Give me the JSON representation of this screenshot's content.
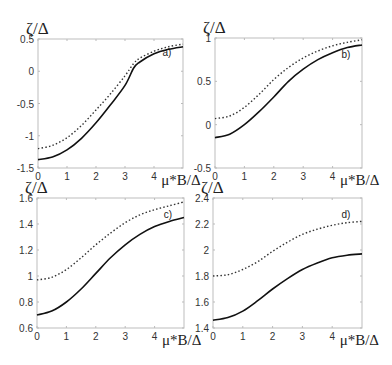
{
  "chart_data": [
    {
      "type": "line",
      "panel": "a)",
      "ylabel": "ζ/Δ",
      "xlabel": "μ*B/Δ",
      "xlim": [
        0,
        5
      ],
      "ylim": [
        -1.5,
        0.5
      ],
      "xticks": [
        "0",
        "1",
        "2",
        "3",
        "4"
      ],
      "yticks": [
        "0.5",
        "0",
        "-0.5",
        "-1",
        "-1.5"
      ],
      "box": {
        "left": 38,
        "top": 39,
        "right": 183,
        "bottom": 168
      },
      "x": [
        0,
        0.5,
        1,
        1.5,
        2,
        2.5,
        3,
        3.3,
        3.5,
        4,
        4.5,
        5
      ],
      "series": [
        {
          "name": "solid",
          "style": "solid",
          "values": [
            -1.37,
            -1.33,
            -1.22,
            -1.04,
            -0.8,
            -0.52,
            -0.22,
            0.05,
            0.14,
            0.27,
            0.34,
            0.38
          ]
        },
        {
          "name": "dotted",
          "style": "dotted",
          "values": [
            -1.2,
            -1.15,
            -1.03,
            -0.84,
            -0.6,
            -0.35,
            -0.07,
            0.12,
            0.2,
            0.31,
            0.38,
            0.42
          ]
        }
      ]
    },
    {
      "type": "line",
      "panel": "b)",
      "ylabel": "ζ/Δ",
      "xlabel": "μ*B/Δ",
      "xlim": [
        0,
        5
      ],
      "ylim": [
        -0.5,
        1
      ],
      "xticks": [
        "0",
        "1",
        "2",
        "3",
        "4"
      ],
      "yticks": [
        "1",
        "0.5",
        "0",
        "-0.5"
      ],
      "box": {
        "left": 215,
        "top": 38,
        "right": 362,
        "bottom": 168
      },
      "x": [
        0,
        0.5,
        1,
        1.5,
        2,
        2.5,
        3,
        3.5,
        4,
        4.5,
        5
      ],
      "series": [
        {
          "name": "solid",
          "style": "solid",
          "values": [
            -0.15,
            -0.11,
            0.0,
            0.15,
            0.32,
            0.5,
            0.64,
            0.75,
            0.83,
            0.89,
            0.92
          ]
        },
        {
          "name": "dotted",
          "style": "dotted",
          "values": [
            0.07,
            0.1,
            0.2,
            0.35,
            0.52,
            0.66,
            0.77,
            0.85,
            0.91,
            0.95,
            0.98
          ]
        }
      ]
    },
    {
      "type": "line",
      "panel": "c)",
      "ylabel": "ζ/Δ",
      "xlabel": "μ*B/Δ",
      "xlim": [
        0,
        5
      ],
      "ylim": [
        0.6,
        1.6
      ],
      "xticks": [
        "0",
        "1",
        "2",
        "3",
        "4"
      ],
      "yticks": [
        "1.6",
        "1.4",
        "1.2",
        "1",
        "0.8",
        "0.6"
      ],
      "box": {
        "left": 37,
        "top": 198,
        "right": 184,
        "bottom": 328
      },
      "x": [
        0,
        0.5,
        1,
        1.5,
        2,
        2.5,
        3,
        3.5,
        4,
        4.5,
        5
      ],
      "series": [
        {
          "name": "solid",
          "style": "solid",
          "values": [
            0.7,
            0.73,
            0.8,
            0.9,
            1.02,
            1.14,
            1.24,
            1.32,
            1.38,
            1.42,
            1.45
          ]
        },
        {
          "name": "dotted",
          "style": "dotted",
          "values": [
            0.97,
            0.99,
            1.05,
            1.14,
            1.24,
            1.33,
            1.41,
            1.47,
            1.51,
            1.54,
            1.57
          ]
        }
      ]
    },
    {
      "type": "line",
      "panel": "d)",
      "ylabel": "ζ/Δ",
      "xlabel": "μ*B/Δ",
      "xlim": [
        0,
        5
      ],
      "ylim": [
        1.4,
        2.4
      ],
      "xticks": [
        "0",
        "1",
        "2",
        "3",
        "4"
      ],
      "yticks": [
        "2.4",
        "2.2",
        "2",
        "1.8",
        "1.6",
        "1.4"
      ],
      "box": {
        "left": 213,
        "top": 198,
        "right": 362,
        "bottom": 328
      },
      "x": [
        0,
        0.5,
        1,
        1.5,
        2,
        2.5,
        3,
        3.5,
        4,
        4.5,
        5
      ],
      "series": [
        {
          "name": "solid",
          "style": "solid",
          "values": [
            1.46,
            1.48,
            1.53,
            1.61,
            1.7,
            1.78,
            1.85,
            1.9,
            1.94,
            1.96,
            1.97
          ]
        },
        {
          "name": "dotted",
          "style": "dotted",
          "values": [
            1.8,
            1.81,
            1.85,
            1.91,
            1.99,
            2.06,
            2.12,
            2.16,
            2.19,
            2.21,
            2.22
          ]
        }
      ]
    }
  ]
}
